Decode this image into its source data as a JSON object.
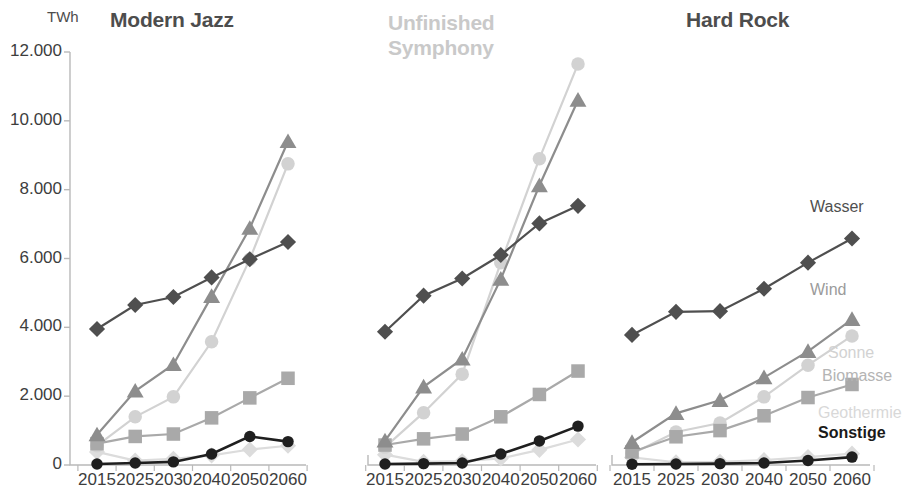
{
  "figure": {
    "unit_label": "TWh",
    "panels": [
      {
        "title": "Modern Jazz",
        "title_tone": "dark"
      },
      {
        "title": "Unfinished\nSymphony",
        "title_tone": "light"
      },
      {
        "title": "Hard Rock",
        "title_tone": "dark"
      }
    ],
    "series_labels": {
      "wasser": "Wasser",
      "wind": "Wind",
      "sonne": "Sonne",
      "biomasse": "Biomasse",
      "geothermie": "Geothermie",
      "sonstige": "Sonstige"
    }
  },
  "chart_data": {
    "type": "line",
    "xlabel": "",
    "ylabel": "TWh",
    "ylim": [
      0,
      12000
    ],
    "yticks": [
      0,
      2000,
      4000,
      6000,
      8000,
      10000,
      12000
    ],
    "ytick_labels": [
      "0",
      "2.000",
      "4.000",
      "6.000",
      "8.000",
      "10.000",
      "12.000"
    ],
    "categories": [
      "2015",
      "2025",
      "2030",
      "2040",
      "2050",
      "2060"
    ],
    "x": [
      2015,
      2025,
      2030,
      2040,
      2050,
      2060
    ],
    "grid": false,
    "legend_position": "right-inline-panel-3",
    "colors": {
      "wasser": "#4f4f4f",
      "wind": "#8d8d8d",
      "sonne": "#d2d2d2",
      "biomasse": "#a9a9a9",
      "geothermie": "#dcdcdc",
      "sonstige": "#1f1f1f"
    },
    "markers": {
      "wasser": "diamond",
      "wind": "triangle",
      "sonne": "circle",
      "biomasse": "square",
      "geothermie": "diamond",
      "sonstige": "circle"
    },
    "panels": [
      {
        "name": "Modern Jazz",
        "series": [
          {
            "name": "Wasser",
            "values": [
              3950,
              4650,
              4880,
              5450,
              5980,
              6480
            ]
          },
          {
            "name": "Wind",
            "values": [
              880,
              2150,
              2920,
              4900,
              6880,
              9400
            ]
          },
          {
            "name": "Sonne",
            "values": [
              560,
              1400,
              1980,
              3580,
              5980,
              8750
            ]
          },
          {
            "name": "Biomasse",
            "values": [
              620,
              830,
              900,
              1370,
              1950,
              2520
            ]
          },
          {
            "name": "Geothermie",
            "values": [
              380,
              130,
              180,
              280,
              450,
              560
            ]
          },
          {
            "name": "Sonstige",
            "values": [
              30,
              60,
              90,
              320,
              830,
              680
            ]
          }
        ]
      },
      {
        "name": "Unfinished Symphony",
        "series": [
          {
            "name": "Wasser",
            "values": [
              3870,
              4920,
              5420,
              6100,
              7020,
              7530
            ]
          },
          {
            "name": "Wind",
            "values": [
              700,
              2270,
              3080,
              5400,
              8120,
              10600
            ]
          },
          {
            "name": "Sonne",
            "values": [
              520,
              1520,
              2640,
              5880,
              8900,
              11650
            ]
          },
          {
            "name": "Biomasse",
            "values": [
              580,
              760,
              900,
              1400,
              2050,
              2730
            ]
          },
          {
            "name": "Geothermie",
            "values": [
              300,
              90,
              110,
              190,
              440,
              740
            ]
          },
          {
            "name": "Sonstige",
            "values": [
              30,
              40,
              60,
              320,
              700,
              1130
            ]
          }
        ]
      },
      {
        "name": "Hard Rock",
        "series": [
          {
            "name": "Wasser",
            "values": [
              3780,
              4450,
              4470,
              5120,
              5880,
              6580
            ]
          },
          {
            "name": "Wind",
            "values": [
              660,
              1500,
              1880,
              2540,
              3300,
              4230
            ]
          },
          {
            "name": "Sonne",
            "values": [
              330,
              960,
              1220,
              1980,
              2900,
              3750
            ]
          },
          {
            "name": "Biomasse",
            "values": [
              380,
              820,
              1000,
              1430,
              1960,
              2340
            ]
          },
          {
            "name": "Geothermie",
            "values": [
              220,
              80,
              90,
              140,
              230,
              330
            ]
          },
          {
            "name": "Sonstige",
            "values": [
              20,
              30,
              40,
              60,
              130,
              230
            ]
          }
        ]
      }
    ]
  }
}
